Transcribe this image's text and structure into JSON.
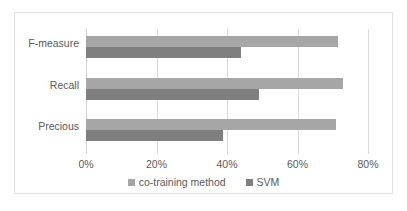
{
  "chart_data": {
    "type": "bar",
    "orientation": "horizontal",
    "title": "",
    "xlabel": "",
    "ylabel": "",
    "categories": [
      "F-measure",
      "Recall",
      "Precious"
    ],
    "series": [
      {
        "name": "co-training method",
        "color": "#a6a6a6",
        "values": [
          71.5,
          73,
          71
        ]
      },
      {
        "name": "SVM",
        "color": "#7f7f7f",
        "values": [
          44,
          49,
          39
        ]
      }
    ],
    "xlim": [
      0,
      80
    ],
    "xticks": [
      0,
      20,
      40,
      60,
      80
    ],
    "xtick_labels": [
      "0%",
      "20%",
      "40%",
      "60%",
      "80%"
    ],
    "grid": true,
    "legend_position": "bottom",
    "value_suffix": "%"
  },
  "colors": {
    "series_light": "#a6a6a6",
    "series_dark": "#7f7f7f",
    "gridline": "#d9d9d9",
    "text": "#5a5a5a",
    "frame_border": "#e2e2e2",
    "background": "#ffffff"
  }
}
